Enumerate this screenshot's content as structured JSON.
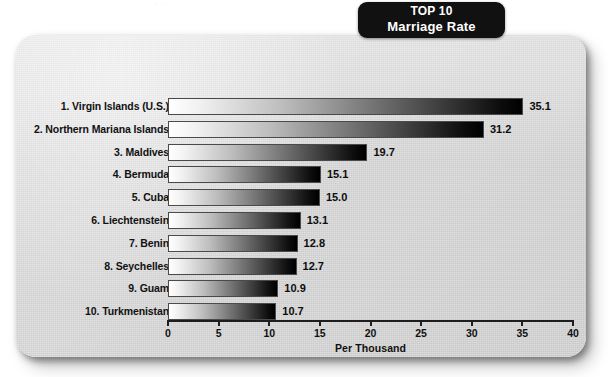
{
  "banner": {
    "line1": "TOP 10",
    "line2": "Marriage Rate"
  },
  "artifact": {
    "text": "· ·"
  },
  "chart_data": {
    "type": "bar",
    "orientation": "horizontal",
    "title": "TOP 10 Marriage Rate",
    "xlabel": "Per Thousand",
    "ylabel": "",
    "xlim": [
      0,
      40
    ],
    "xticks": [
      0,
      5,
      10,
      15,
      20,
      25,
      30,
      35,
      40
    ],
    "xtick_labels": [
      "0",
      "5",
      "10",
      "15",
      "20",
      "25",
      "30",
      "35",
      "40"
    ],
    "grid": false,
    "legend": false,
    "categories": [
      "1. Virgin Islands (U.S.)",
      "2. Northern Mariana Islands",
      "3. Maldives",
      "4. Bermuda",
      "5. Cuba",
      "6. Liechtenstein",
      "7. Benin",
      "8. Seychelles",
      "9. Guam",
      "10. Turkmenistan"
    ],
    "values": [
      35.1,
      31.2,
      19.7,
      15.1,
      15.0,
      13.1,
      12.8,
      12.7,
      10.9,
      10.7
    ],
    "value_labels": [
      "35.1",
      "31.2",
      "19.7",
      "15.1",
      "15.0",
      "13.1",
      "12.8",
      "12.7",
      "10.9",
      "10.7"
    ],
    "bar_style": "white-to-black horizontal gradient per bar"
  },
  "colors": {
    "card_background": "#d6d6d6",
    "banner_background": "#111111",
    "banner_text": "#ffffff",
    "axis": "#1d1d1d",
    "text": "#111111",
    "bar_start": "#ffffff",
    "bar_end": "#000000"
  }
}
